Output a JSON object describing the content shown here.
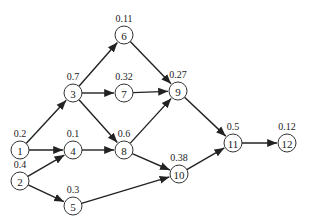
{
  "diagram": {
    "type": "directed-acyclic-graph",
    "nodes": [
      {
        "id": "1",
        "x": 20,
        "y": 150,
        "weight": "0.2"
      },
      {
        "id": "2",
        "x": 20,
        "y": 181,
        "weight": "0.4"
      },
      {
        "id": "3",
        "x": 73,
        "y": 93,
        "weight": "0.7"
      },
      {
        "id": "4",
        "x": 73,
        "y": 150,
        "weight": "0.1"
      },
      {
        "id": "5",
        "x": 73,
        "y": 206,
        "weight": "0.3"
      },
      {
        "id": "6",
        "x": 124,
        "y": 35,
        "weight": "0.11"
      },
      {
        "id": "7",
        "x": 124,
        "y": 93,
        "weight": "0.32"
      },
      {
        "id": "8",
        "x": 124,
        "y": 150,
        "weight": "0.6"
      },
      {
        "id": "9",
        "x": 178,
        "y": 91,
        "weight": "0.27"
      },
      {
        "id": "10",
        "x": 179,
        "y": 174,
        "weight": "0.38"
      },
      {
        "id": "11",
        "x": 233,
        "y": 143,
        "weight": "0.5"
      },
      {
        "id": "12",
        "x": 287,
        "y": 143,
        "weight": "0.12"
      }
    ],
    "edges": [
      {
        "from": "1",
        "to": "3"
      },
      {
        "from": "1",
        "to": "4"
      },
      {
        "from": "2",
        "to": "4"
      },
      {
        "from": "2",
        "to": "5"
      },
      {
        "from": "3",
        "to": "6"
      },
      {
        "from": "3",
        "to": "7"
      },
      {
        "from": "3",
        "to": "8"
      },
      {
        "from": "4",
        "to": "8"
      },
      {
        "from": "5",
        "to": "10"
      },
      {
        "from": "6",
        "to": "9"
      },
      {
        "from": "7",
        "to": "9"
      },
      {
        "from": "8",
        "to": "9"
      },
      {
        "from": "8",
        "to": "10"
      },
      {
        "from": "9",
        "to": "11"
      },
      {
        "from": "10",
        "to": "11"
      },
      {
        "from": "11",
        "to": "12"
      }
    ],
    "colors": {
      "background": "#ffffff",
      "stroke": "#222222",
      "text": "#222222"
    },
    "node_radius": 9
  }
}
